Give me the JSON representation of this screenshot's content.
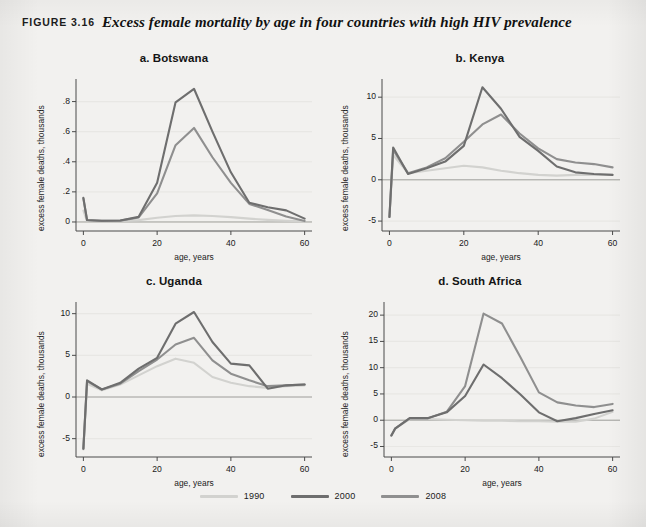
{
  "caption": {
    "figure_number": "FIGURE 3.16",
    "title": "Excess female mortality by age in four countries with high HIV prevalence"
  },
  "legend": {
    "items": [
      {
        "label": "1990",
        "color": "#d2d2cf"
      },
      {
        "label": "2000",
        "color": "#6e6e6e"
      },
      {
        "label": "2008",
        "color": "#8f8f8f"
      }
    ]
  },
  "colors": {
    "series_1990": "#d2d2cf",
    "series_2000": "#6e6e6e",
    "series_2008": "#8f8f8f",
    "axis": "#4a4a4a",
    "gridline": "#e8e7e4",
    "zeroline": "#9a9a96",
    "panel_bg": "#f2f1ef",
    "text": "#1a1a1a"
  },
  "chart_data": [
    {
      "id": "botswana",
      "type": "line",
      "letter": "a.",
      "title": "Botswana",
      "xlabel": "age, years",
      "ylabel": "excess female deaths, thousands",
      "x": [
        0,
        1,
        5,
        10,
        15,
        20,
        25,
        30,
        35,
        40,
        45,
        50,
        55,
        60
      ],
      "xlim": [
        -2,
        62
      ],
      "ylim": [
        -0.06,
        0.95
      ],
      "xticks": [
        0,
        20,
        40,
        60
      ],
      "xticklabels": [
        "0",
        "20",
        "40",
        "60"
      ],
      "yticks": [
        0,
        0.2,
        0.4,
        0.6,
        0.8
      ],
      "yticklabels": [
        "0",
        ".2",
        ".4",
        ".6",
        ".8"
      ],
      "grid": true,
      "legend_position": "below-figure",
      "series": [
        {
          "name": "1990",
          "color": "#d2d2cf",
          "values": [
            0.075,
            0.005,
            0.005,
            0.006,
            0.012,
            0.028,
            0.04,
            0.044,
            0.04,
            0.032,
            0.022,
            0.014,
            0.008,
            0.004
          ]
        },
        {
          "name": "2000",
          "color": "#6e6e6e",
          "values": [
            0.16,
            0.013,
            0.008,
            0.01,
            0.034,
            0.26,
            0.795,
            0.885,
            0.6,
            0.33,
            0.128,
            0.098,
            0.077,
            0.022
          ]
        },
        {
          "name": "2008",
          "color": "#8f8f8f",
          "values": [
            0.155,
            0.011,
            0.007,
            0.009,
            0.03,
            0.19,
            0.51,
            0.625,
            0.43,
            0.26,
            0.12,
            0.08,
            0.036,
            0.006
          ]
        }
      ]
    },
    {
      "id": "kenya",
      "type": "line",
      "letter": "b.",
      "title": "Kenya",
      "xlabel": "age, years",
      "ylabel": "excess female deaths, thousands",
      "x": [
        0,
        1,
        5,
        10,
        15,
        20,
        25,
        30,
        35,
        40,
        45,
        50,
        55,
        60
      ],
      "xlim": [
        -2,
        62
      ],
      "ylim": [
        -6.2,
        12.2
      ],
      "xticks": [
        0,
        20,
        40,
        60
      ],
      "xticklabels": [
        "0",
        "20",
        "40",
        "60"
      ],
      "yticks": [
        -5,
        0,
        5,
        10
      ],
      "yticklabels": [
        "-5",
        "0",
        "5",
        "10"
      ],
      "grid": true,
      "legend_position": "below-figure",
      "series": [
        {
          "name": "1990",
          "color": "#d2d2cf",
          "values": [
            -4.5,
            3.0,
            0.8,
            1.1,
            1.4,
            1.7,
            1.5,
            1.1,
            0.8,
            0.6,
            0.5,
            0.6,
            0.6,
            0.6
          ]
        },
        {
          "name": "2000",
          "color": "#6e6e6e",
          "values": [
            -4.5,
            3.9,
            0.7,
            1.4,
            2.2,
            4.1,
            11.2,
            8.6,
            5.2,
            3.5,
            1.6,
            0.9,
            0.7,
            0.6
          ]
        },
        {
          "name": "2008",
          "color": "#8f8f8f",
          "values": [
            -4.5,
            3.6,
            0.8,
            1.5,
            2.6,
            4.6,
            6.7,
            7.9,
            5.6,
            3.8,
            2.5,
            2.1,
            1.9,
            1.5
          ]
        }
      ]
    },
    {
      "id": "uganda",
      "type": "line",
      "letter": "c.",
      "title": "Uganda",
      "xlabel": "age, years",
      "ylabel": "excess female deaths, thousands",
      "x": [
        0,
        1,
        5,
        10,
        15,
        20,
        25,
        30,
        35,
        40,
        45,
        50,
        55,
        60
      ],
      "xlim": [
        -2,
        62
      ],
      "ylim": [
        -7.2,
        11.4
      ],
      "xticks": [
        0,
        20,
        40,
        60
      ],
      "xticklabels": [
        "0",
        "20",
        "40",
        "60"
      ],
      "yticks": [
        -5,
        0,
        5,
        10
      ],
      "yticklabels": [
        "-5",
        "0",
        "5",
        "10"
      ],
      "grid": true,
      "legend_position": "below-figure",
      "series": [
        {
          "name": "1990",
          "color": "#d2d2cf",
          "values": [
            -6.3,
            1.6,
            0.8,
            1.5,
            2.6,
            3.7,
            4.6,
            4.1,
            2.4,
            1.7,
            1.3,
            1.1,
            1.3,
            1.4
          ]
        },
        {
          "name": "2000",
          "color": "#6e6e6e",
          "values": [
            -6.2,
            2.0,
            0.9,
            1.7,
            3.4,
            4.7,
            8.8,
            10.2,
            6.6,
            4.0,
            3.8,
            1.0,
            1.4,
            1.5
          ]
        },
        {
          "name": "2008",
          "color": "#8f8f8f",
          "values": [
            -6.2,
            1.9,
            0.9,
            1.6,
            3.1,
            4.5,
            6.3,
            7.1,
            4.4,
            2.8,
            2.0,
            1.3,
            1.4,
            1.5
          ]
        }
      ]
    },
    {
      "id": "south-africa",
      "type": "line",
      "letter": "d.",
      "title": "South Africa",
      "xlabel": "age, years",
      "ylabel": "excess female deaths, thousands",
      "x": [
        0,
        1,
        5,
        10,
        15,
        20,
        25,
        30,
        35,
        40,
        45,
        50,
        55,
        60
      ],
      "xlim": [
        -2,
        62
      ],
      "ylim": [
        -7.0,
        22.5
      ],
      "xticks": [
        0,
        20,
        40,
        60
      ],
      "xticklabels": [
        "0",
        "20",
        "40",
        "60"
      ],
      "yticks": [
        -5,
        0,
        5,
        10,
        15,
        20
      ],
      "yticklabels": [
        "-5",
        "0",
        "5",
        "10",
        "15",
        "20"
      ],
      "grid": true,
      "legend_position": "below-figure",
      "series": [
        {
          "name": "1990",
          "color": "#d2d2cf",
          "values": [
            -2.9,
            -1.6,
            0.2,
            0.2,
            0.1,
            0.0,
            -0.1,
            -0.1,
            -0.2,
            -0.2,
            -0.3,
            -0.3,
            0.3,
            1.6
          ]
        },
        {
          "name": "2000",
          "color": "#6e6e6e",
          "values": [
            -2.9,
            -1.6,
            0.4,
            0.4,
            1.5,
            4.6,
            10.6,
            8.0,
            4.9,
            1.5,
            -0.2,
            0.4,
            1.2,
            1.9
          ]
        },
        {
          "name": "2008",
          "color": "#8f8f8f",
          "values": [
            -2.9,
            -1.6,
            0.4,
            0.4,
            1.6,
            6.5,
            20.3,
            18.4,
            12.0,
            5.3,
            3.4,
            2.8,
            2.5,
            3.1
          ]
        }
      ]
    }
  ]
}
